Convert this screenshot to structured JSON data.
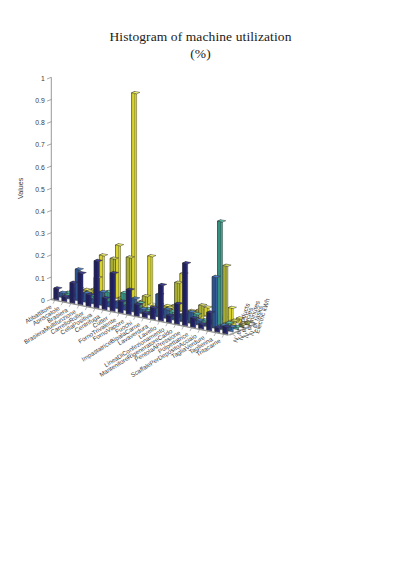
{
  "figure": {
    "title_line1": "Histogram of machine utilization",
    "title_line2": "(%)",
    "background": "#ffffff"
  },
  "axes": {
    "value_axis": {
      "label": "Values",
      "ticks": [
        "0",
        "0.1",
        "0.2",
        "0.3",
        "0.4",
        "0.5",
        "0.6",
        "0.7",
        "0.8",
        "0.9",
        "1"
      ],
      "min": 0,
      "max": 1
    },
    "category_axis": {
      "label": "",
      "categories": [
        "Abbattitore",
        "Apriscatole",
        "Brasiera",
        "BrasieraMultifunzione",
        "CarrelloRoller",
        "CellaPositiva",
        "Centrifuga",
        "Cutter",
        "FornoTrivalente",
        "FornoVapore",
        "Fuochi",
        "ImpastatriceBipalaCarne",
        "Lavaverdura",
        "Lavello",
        "LineaDiConfezionamento",
        "MantenitoreRigeneratoreCaldo",
        "PentolaAPressione",
        "Polpettatrice",
        "ScaffalePerDepositoAcciaio",
        "TagliaVerdure",
        "Taglierina",
        "Tritacarne"
      ]
    },
    "depth_axis": {
      "label": "",
      "series_names": [
        "N. of products",
        "N. of cycles",
        "N. of minutes",
        "N. of tasks",
        "Electric kWh"
      ]
    }
  },
  "colors": {
    "series": [
      "#2b2b7e",
      "#3a6cb4",
      "#45b6a0",
      "#cfd44a",
      "#f5f03c"
    ],
    "series_top": [
      "#3c3c96",
      "#4d82cc",
      "#5fc9b4",
      "#dde26a",
      "#fbf86a"
    ],
    "series_side": [
      "#1f1f60",
      "#2d538c",
      "#349182",
      "#a8ac35",
      "#d8d32c"
    ],
    "edge": "#2a2a2a",
    "floor": "#ffffff",
    "grid": "#d8d8d8",
    "axis": "#6b6b6b"
  },
  "chart_data": {
    "type": "bar",
    "title": "Histogram of machine utilization (%)",
    "xlabel": "",
    "ylabel": "Values",
    "zlabel": "",
    "ylim": [
      0,
      1
    ],
    "grid": false,
    "legend": "none",
    "style": "3d-bar-matlab",
    "categories": [
      "Abbattitore",
      "Apriscatole",
      "Brasiera",
      "BrasieraMultifunzione",
      "CarrelloRoller",
      "CellaPositiva",
      "Centrifuga",
      "Cutter",
      "FornoTrivalente",
      "FornoVapore",
      "Fuochi",
      "ImpastatriceBipalaCarne",
      "Lavaverdura",
      "Lavello",
      "LineaDiConfezionamento",
      "MantenitoreRigeneratoreCaldo",
      "PentolaAPressione",
      "Polpettatrice",
      "ScaffalePerDepositoAcciaio",
      "TagliaVerdure",
      "Taglierina",
      "Tritacarne"
    ],
    "series": [
      {
        "name": "N. of products",
        "color": "#2b2b7e",
        "values": [
          0.05,
          0.02,
          0.09,
          0.14,
          0.05,
          0.21,
          0.05,
          0.17,
          0.05,
          0.11,
          0.05,
          0.02,
          0.05,
          0.16,
          0.03,
          0.09,
          0.28,
          0.04,
          0.02,
          0.08,
          0.02,
          0.03
        ]
      },
      {
        "name": "N. of cycles",
        "color": "#3a6cb4",
        "values": [
          0.02,
          0.01,
          0.14,
          0.04,
          0.02,
          0.06,
          0.02,
          0.03,
          0.02,
          0.06,
          0.02,
          0.01,
          0.1,
          0.04,
          0.02,
          0.03,
          0.05,
          0.02,
          0.01,
          0.23,
          0.02,
          0.02
        ]
      },
      {
        "name": "N. of minutes",
        "color": "#45b6a0",
        "values": [
          0.01,
          0.01,
          0.02,
          0.02,
          0.01,
          0.05,
          0.01,
          0.06,
          0.01,
          0.03,
          0.01,
          0.01,
          0.02,
          0.02,
          0.01,
          0.02,
          0.03,
          0.01,
          0.01,
          0.47,
          0.02,
          0.01
        ]
      },
      {
        "name": "N. of tasks",
        "color": "#cfd44a",
        "values": [
          0.01,
          0.01,
          0.02,
          0.09,
          0.01,
          0.19,
          0.02,
          0.21,
          0.01,
          0.05,
          0.01,
          0.01,
          0.02,
          0.14,
          0.01,
          0.02,
          0.06,
          0.01,
          0.01,
          0.26,
          0.02,
          0.01
        ]
      },
      {
        "name": "Electric kWh",
        "color": "#f5f03c",
        "values": [
          0.01,
          0.01,
          0.02,
          0.18,
          0.01,
          0.24,
          0.02,
          0.94,
          0.01,
          0.22,
          0.01,
          0.01,
          0.02,
          0.17,
          0.01,
          0.02,
          0.04,
          0.01,
          0.01,
          0.06,
          0.02,
          0.01
        ]
      }
    ]
  }
}
